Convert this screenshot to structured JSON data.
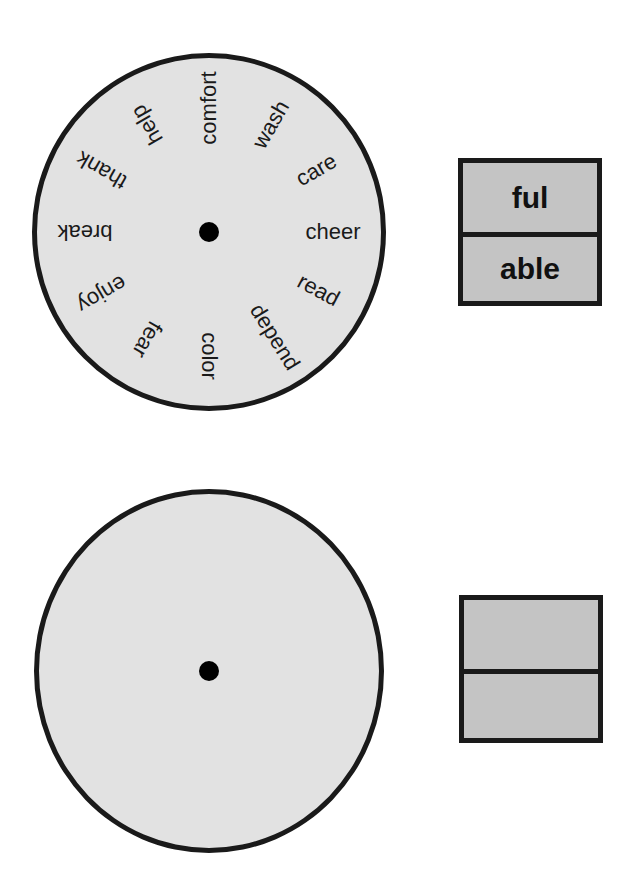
{
  "wheel_top": {
    "words": [
      {
        "text": "comfort",
        "angle": 0
      },
      {
        "text": "wash",
        "angle": 30
      },
      {
        "text": "care",
        "angle": 60
      },
      {
        "text": "cheer",
        "angle": 90
      },
      {
        "text": "read",
        "angle": 118
      },
      {
        "text": "depend",
        "angle": 148
      },
      {
        "text": "color",
        "angle": 180
      },
      {
        "text": "fear",
        "angle": 210
      },
      {
        "text": "enjoy",
        "angle": 240
      },
      {
        "text": "break",
        "angle": 270
      },
      {
        "text": "thank",
        "angle": 300
      },
      {
        "text": "help",
        "angle": 330
      }
    ]
  },
  "wheel_bottom": {
    "words": []
  },
  "suffix_box_top": {
    "top": "ful",
    "bottom": "able"
  },
  "suffix_box_bottom": {
    "top": "",
    "bottom": ""
  },
  "colors": {
    "wheel_fill": "#e2e2e2",
    "box_fill": "#c4c4c4",
    "outline": "#1a1a1a"
  }
}
